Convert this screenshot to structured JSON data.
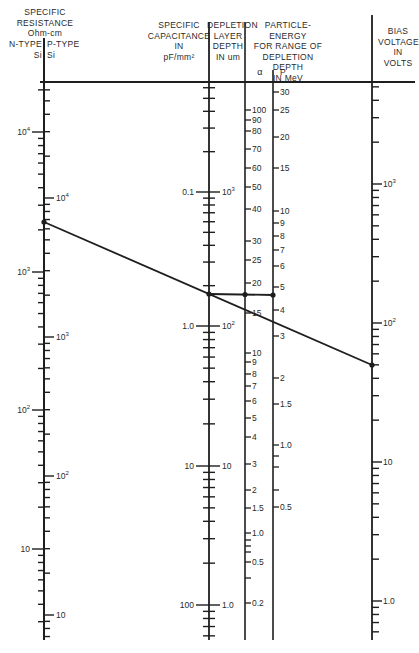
{
  "headers": {
    "resistance": [
      "SPECIFIC",
      "RESISTANCE",
      "Ohm-cm"
    ],
    "n_type": [
      "N-TYPE",
      "Si"
    ],
    "p_type": [
      "P-TYPE",
      "Si"
    ],
    "capacitance": [
      "SPECIFIC",
      "CAPACITANCE",
      "IN",
      "pF/mm²"
    ],
    "depletion": [
      "DEPLETION",
      "LAYER",
      "DEPTH",
      "IN um"
    ],
    "energy": [
      "PARTICLE-ENERGY",
      "FOR RANGE OF",
      "DEPLETION DEPTH",
      "IN MeV"
    ],
    "alpha": "α",
    "proton": "P",
    "bias": [
      "BIAS",
      "VOLTAGE",
      "IN",
      "VOLTS"
    ]
  },
  "scales": {
    "n_type_resistance": [
      {
        "label": "10",
        "sup": "4",
        "y": 132
      },
      {
        "label": "10",
        "sup": "3",
        "y": 272
      },
      {
        "label": "10",
        "sup": "2",
        "y": 410
      },
      {
        "label": "10",
        "sup": "",
        "y": 549
      }
    ],
    "p_type_resistance": [
      {
        "label": "10",
        "sup": "4",
        "y": 198
      },
      {
        "label": "10",
        "sup": "3",
        "y": 337
      },
      {
        "label": "10",
        "sup": "2",
        "y": 476
      },
      {
        "label": "10",
        "sup": "",
        "y": 615
      }
    ],
    "capacitance": [
      {
        "label": "0.1",
        "y": 192
      },
      {
        "label": "1.0",
        "y": 326
      },
      {
        "label": "10",
        "y": 466
      },
      {
        "label": "100",
        "y": 605
      }
    ],
    "depletion_depth": [
      {
        "label": "10",
        "sup": "3",
        "y": 192
      },
      {
        "label": "10",
        "sup": "2",
        "y": 326
      },
      {
        "label": "10",
        "sup": "",
        "y": 466
      },
      {
        "label": "1.0",
        "sup": "",
        "y": 605
      }
    ],
    "alpha_energy": [
      {
        "label": "100",
        "y": 110
      },
      {
        "label": "90",
        "y": 120
      },
      {
        "label": "80",
        "y": 131
      },
      {
        "label": "70",
        "y": 149
      },
      {
        "label": "60",
        "y": 168
      },
      {
        "label": "50",
        "y": 187
      },
      {
        "label": "40",
        "y": 209
      },
      {
        "label": "30",
        "y": 241
      },
      {
        "label": "25",
        "y": 260
      },
      {
        "label": "20",
        "y": 283
      },
      {
        "label": "15",
        "y": 313
      },
      {
        "label": "10",
        "y": 353
      },
      {
        "label": "9",
        "y": 362
      },
      {
        "label": "8",
        "y": 374
      },
      {
        "label": "7",
        "y": 386
      },
      {
        "label": "6",
        "y": 401
      },
      {
        "label": "5",
        "y": 418
      },
      {
        "label": "4",
        "y": 437
      },
      {
        "label": "3",
        "y": 464
      },
      {
        "label": "2",
        "y": 490
      },
      {
        "label": "1.5",
        "y": 508
      },
      {
        "label": "1.0",
        "y": 533
      },
      {
        "label": "0.5",
        "y": 562
      },
      {
        "label": "0.2",
        "y": 603
      }
    ],
    "proton_energy": [
      {
        "label": "30",
        "y": 92
      },
      {
        "label": "25",
        "y": 110
      },
      {
        "label": "20",
        "y": 137
      },
      {
        "label": "15",
        "y": 168
      },
      {
        "label": "10",
        "y": 211
      },
      {
        "label": "9",
        "y": 223
      },
      {
        "label": "8",
        "y": 236
      },
      {
        "label": "7",
        "y": 250
      },
      {
        "label": "6",
        "y": 266
      },
      {
        "label": "5",
        "y": 287
      },
      {
        "label": "4",
        "y": 310
      },
      {
        "label": "3",
        "y": 336
      },
      {
        "label": "2",
        "y": 378
      },
      {
        "label": "1.5",
        "y": 404
      },
      {
        "label": "1.0",
        "y": 445
      },
      {
        "label": "0.5",
        "y": 507
      }
    ],
    "bias_voltage": [
      {
        "label": "10",
        "sup": "3",
        "y": 184
      },
      {
        "label": "10",
        "sup": "2",
        "y": 323
      },
      {
        "label": "10",
        "sup": "",
        "y": 462
      },
      {
        "label": "1.0",
        "sup": "",
        "y": 601
      }
    ]
  },
  "example": {
    "line1": {
      "x1": 44,
      "y1": 222,
      "x2": 372,
      "y2": 365
    },
    "line2": {
      "x1": 209,
      "y1": 294,
      "x2": 273,
      "y2": 295
    }
  }
}
